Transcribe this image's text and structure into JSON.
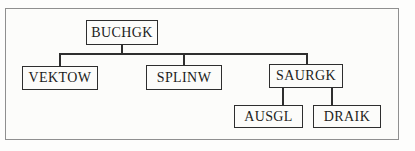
{
  "diagram": {
    "type": "tree",
    "nodes": [
      {
        "id": "buchgk",
        "label": "BUCHGK",
        "level": 0,
        "parent": null
      },
      {
        "id": "vektow",
        "label": "VEKTOW",
        "level": 1,
        "parent": "buchgk"
      },
      {
        "id": "splinw",
        "label": "SPLINW",
        "level": 1,
        "parent": "buchgk"
      },
      {
        "id": "saurgk",
        "label": "SAURGK",
        "level": 1,
        "parent": "buchgk"
      },
      {
        "id": "ausgl",
        "label": "AUSGL",
        "level": 2,
        "parent": "saurgk"
      },
      {
        "id": "draik",
        "label": "DRAIK",
        "level": 2,
        "parent": "saurgk"
      }
    ],
    "edges": [
      {
        "from": "buchgk",
        "to": "vektow"
      },
      {
        "from": "buchgk",
        "to": "splinw"
      },
      {
        "from": "buchgk",
        "to": "saurgk"
      },
      {
        "from": "saurgk",
        "to": "ausgl"
      },
      {
        "from": "saurgk",
        "to": "draik"
      }
    ],
    "colors": {
      "node_border": "#2e2e2e",
      "connector": "#2e2e2e",
      "frame_border": "#8f8f8f",
      "text": "#1c1c1c",
      "background": "#fcfcfa"
    }
  }
}
